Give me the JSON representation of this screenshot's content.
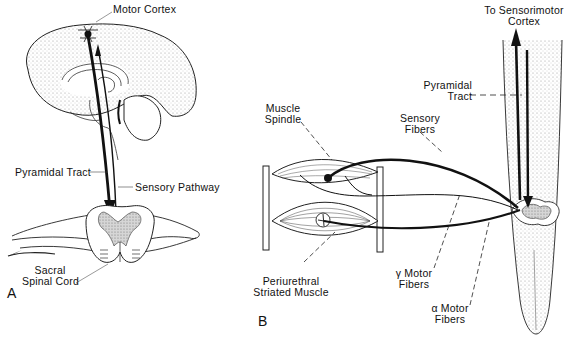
{
  "figure": {
    "panels": [
      {
        "id": "A",
        "letter": "A",
        "labels": {
          "motor_cortex": "Motor Cortex",
          "pyramidal_tract": "Pyramidal Tract",
          "sensory_pathway": "Sensory Pathway",
          "sacral_spinal_cord_line1": "Sacral",
          "sacral_spinal_cord_line2": "Spinal Cord"
        }
      },
      {
        "id": "B",
        "letter": "B",
        "labels": {
          "to_sensorimotor_line1": "To Sensorimotor",
          "to_sensorimotor_line2": "Cortex",
          "pyramidal_tract_line1": "Pyramidal",
          "pyramidal_tract_line2": "Tract",
          "muscle_spindle_line1": "Muscle",
          "muscle_spindle_line2": "Spindle",
          "sensory_fibers_line1": "Sensory",
          "sensory_fibers_line2": "Fibers",
          "gamma_motor_line1": "γ Motor",
          "gamma_motor_line2": "Fibers",
          "alpha_motor_line1": "α Motor",
          "alpha_motor_line2": "Fibers",
          "periurethral_line1": "Periurethral",
          "periurethral_line2": "Striated Muscle"
        }
      }
    ],
    "colors": {
      "ink": "#111111",
      "stipple": "#bdbdbd",
      "background": "#ffffff"
    }
  }
}
